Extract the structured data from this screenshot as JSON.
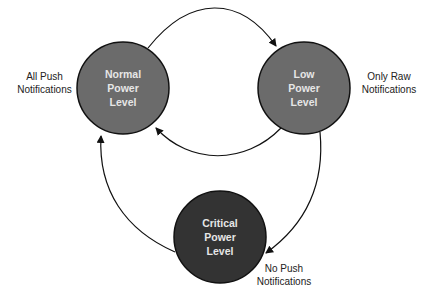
{
  "diagram": {
    "type": "state-diagram",
    "nodes": [
      {
        "id": "normal",
        "lines": [
          "Normal",
          "Power",
          "Level"
        ],
        "fill": "#6b6b6b",
        "cx": 123,
        "cy": 88,
        "r": 46
      },
      {
        "id": "low",
        "lines": [
          "Low",
          "Power",
          "Level"
        ],
        "fill": "#6b6b6b",
        "cx": 304,
        "cy": 88,
        "r": 46
      },
      {
        "id": "critical",
        "lines": [
          "Critical",
          "Power",
          "Level"
        ],
        "fill": "#333333",
        "cx": 220,
        "cy": 237,
        "r": 46
      }
    ],
    "annotations": {
      "normal": [
        "All Push",
        "Notifications"
      ],
      "low": [
        "Only Raw",
        "Notifications"
      ],
      "critical": [
        "No Push",
        "Notifications"
      ]
    },
    "edges": [
      {
        "from": "normal",
        "to": "low"
      },
      {
        "from": "low",
        "to": "normal"
      },
      {
        "from": "low",
        "to": "critical"
      },
      {
        "from": "critical",
        "to": "normal"
      }
    ]
  }
}
